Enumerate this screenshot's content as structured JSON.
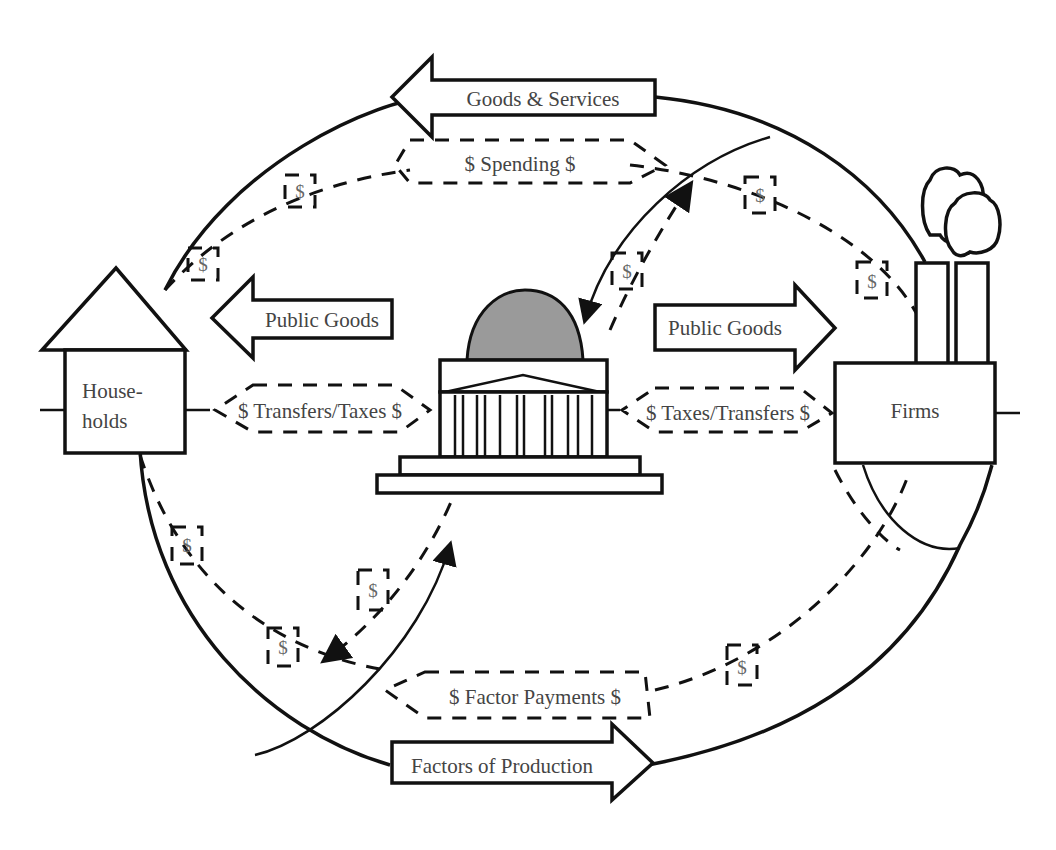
{
  "diagram": {
    "colors": {
      "line": "#111111",
      "text": "#444444",
      "dome": "#9a9a9a",
      "background": "#ffffff"
    },
    "nodes": {
      "households": {
        "label_line1": "House-",
        "label_line2": "holds",
        "icon": "house-icon"
      },
      "firms": {
        "label": "Firms",
        "icon": "factory-icon"
      },
      "government": {
        "icon": "capitol-building-icon"
      }
    },
    "flows": {
      "goods_services": "Goods & Services",
      "spending": "$ Spending $",
      "public_goods_left": "Public Goods",
      "public_goods_right": "Public Goods",
      "transfers_taxes": "$ Transfers/Taxes $",
      "taxes_transfers": "$ Taxes/Transfers $",
      "factor_payments": "$ Factor Payments $",
      "factors_production": "Factors of Production"
    },
    "money_tag": "$"
  }
}
